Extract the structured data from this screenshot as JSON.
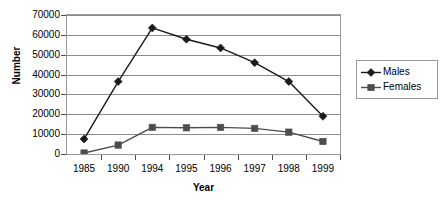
{
  "chart_data": {
    "type": "line",
    "title": "",
    "xlabel": "Year",
    "ylabel": "Number",
    "categories": [
      "1985",
      "1990",
      "1994",
      "1995",
      "1996",
      "1997",
      "1998",
      "1999"
    ],
    "series": [
      {
        "name": "Males",
        "marker": "diamond",
        "color": "#1a1a1a",
        "values": [
          7500,
          36500,
          63500,
          57800,
          53400,
          46000,
          36500,
          19000
        ]
      },
      {
        "name": "Females",
        "marker": "square",
        "color": "#4d4d4d",
        "values": [
          500,
          4500,
          13400,
          13200,
          13400,
          12900,
          11000,
          6300
        ]
      }
    ],
    "ylim": [
      0,
      70000
    ],
    "ytick_values": [
      70000,
      60000,
      50000,
      40000,
      30000,
      20000,
      10000,
      0
    ],
    "ytick_labels": [
      "70000",
      "60000",
      "50000",
      "40000",
      "30000",
      "20000",
      "10000",
      "0"
    ],
    "grid": true,
    "grid_axis": "y",
    "legend_position": "right",
    "plot_border_color": "#9a9a9a",
    "gridline_color": "#8c8c8c",
    "background_color": "#ffffff"
  }
}
